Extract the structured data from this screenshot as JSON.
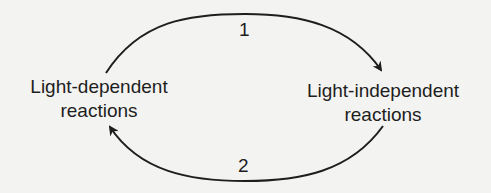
{
  "diagram": {
    "type": "cycle",
    "nodes": [
      {
        "id": "left",
        "line1": "Light-dependent",
        "line2": "reactions"
      },
      {
        "id": "right",
        "line1": "Light-independent",
        "line2": "reactions"
      }
    ],
    "edges": [
      {
        "from": "left",
        "to": "right",
        "label": "1"
      },
      {
        "from": "right",
        "to": "left",
        "label": "2"
      }
    ],
    "colors": {
      "background": "#f3f3f1",
      "ink": "#1e1e1e"
    }
  }
}
